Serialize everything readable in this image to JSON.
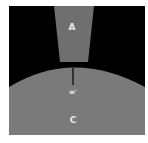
{
  "diagram": {
    "background_color": "#000000",
    "region_a": {
      "label": "A",
      "color": "#6f6f6f"
    },
    "region_c": {
      "label": "C",
      "color": "#7a7a7a"
    },
    "gap_marker": {
      "label": "w'",
      "line_color": "#000000"
    }
  }
}
